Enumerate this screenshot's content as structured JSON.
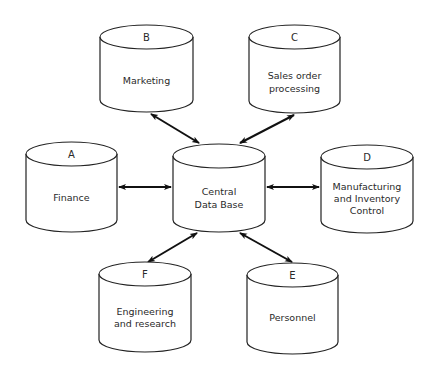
{
  "diagram": {
    "type": "database-hub",
    "center": {
      "id": "central",
      "letter": "",
      "lines": [
        "Central",
        "Data Base"
      ]
    },
    "nodes": [
      {
        "id": "A",
        "letter": "A",
        "lines": [
          "Finance"
        ]
      },
      {
        "id": "B",
        "letter": "B",
        "lines": [
          "Marketing"
        ]
      },
      {
        "id": "C",
        "letter": "C",
        "lines": [
          "Sales order",
          "processing"
        ]
      },
      {
        "id": "D",
        "letter": "D",
        "lines": [
          "Manufacturing",
          "and Inventory",
          "Control"
        ]
      },
      {
        "id": "E",
        "letter": "E",
        "lines": [
          "Personnel"
        ]
      },
      {
        "id": "F",
        "letter": "F",
        "lines": [
          "Engineering",
          "and research"
        ]
      }
    ],
    "edges": [
      {
        "from": "central",
        "to": "A",
        "direction": "bidirectional"
      },
      {
        "from": "central",
        "to": "B",
        "direction": "bidirectional"
      },
      {
        "from": "central",
        "to": "C",
        "direction": "bidirectional"
      },
      {
        "from": "central",
        "to": "D",
        "direction": "bidirectional"
      },
      {
        "from": "central",
        "to": "E",
        "direction": "bidirectional"
      },
      {
        "from": "central",
        "to": "F",
        "direction": "bidirectional"
      }
    ],
    "colors": {
      "stroke": "#222222",
      "text": "#2a2a2a",
      "background": "#ffffff"
    }
  }
}
